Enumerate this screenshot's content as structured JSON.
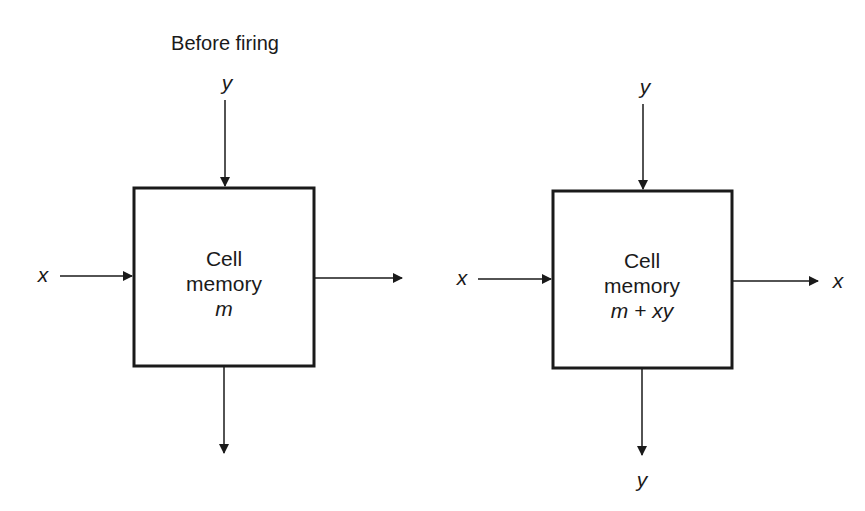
{
  "diagram": {
    "title": "Before firing",
    "colors": {
      "stroke": "#1a1a1a",
      "background": "#ffffff"
    },
    "cells": [
      {
        "id": "before",
        "label_line1": "Cell",
        "label_line2": "memory",
        "memory_value": "m",
        "inputs": {
          "top": "y",
          "left": "x"
        },
        "outputs": {
          "right": "",
          "bottom": ""
        }
      },
      {
        "id": "after",
        "label_line1": "Cell",
        "label_line2": "memory",
        "memory_value": "m + xy",
        "inputs": {
          "top": "y",
          "left": "x"
        },
        "outputs": {
          "right": "x",
          "bottom": "y"
        }
      }
    ]
  }
}
